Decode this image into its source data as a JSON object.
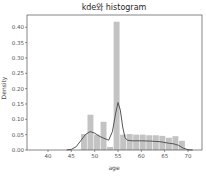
{
  "chart_data": {
    "type": "bar",
    "title": "kde와 histogram",
    "xlabel": "age",
    "ylabel": "Density",
    "xlim": [
      35.5,
      73
    ],
    "ylim": [
      0,
      0.44
    ],
    "xticks": [
      40,
      45,
      50,
      55,
      60,
      65,
      70
    ],
    "yticks": [
      0.0,
      0.05,
      0.1,
      0.15,
      0.2,
      0.25,
      0.3,
      0.35,
      0.4
    ],
    "grid": false,
    "legend": null,
    "histogram": {
      "color": "#b8b8b8",
      "bins": [
        {
          "x0": 47.0,
          "x1": 48.4,
          "density": 0.052
        },
        {
          "x0": 48.4,
          "x1": 49.8,
          "density": 0.115
        },
        {
          "x0": 49.8,
          "x1": 51.2,
          "density": 0.05
        },
        {
          "x0": 51.2,
          "x1": 52.6,
          "density": 0.092
        },
        {
          "x0": 52.6,
          "x1": 54.0,
          "density": 0.01
        },
        {
          "x0": 54.0,
          "x1": 55.4,
          "density": 0.418
        },
        {
          "x0": 55.4,
          "x1": 56.8,
          "density": 0.05
        },
        {
          "x0": 56.8,
          "x1": 58.2,
          "density": 0.052
        },
        {
          "x0": 58.2,
          "x1": 59.6,
          "density": 0.05
        },
        {
          "x0": 59.6,
          "x1": 61.0,
          "density": 0.05
        },
        {
          "x0": 61.0,
          "x1": 62.4,
          "density": 0.048
        },
        {
          "x0": 62.4,
          "x1": 63.8,
          "density": 0.048
        },
        {
          "x0": 63.8,
          "x1": 65.2,
          "density": 0.046
        },
        {
          "x0": 65.2,
          "x1": 66.6,
          "density": 0.04
        },
        {
          "x0": 66.6,
          "x1": 68.0,
          "density": 0.045
        },
        {
          "x0": 68.0,
          "x1": 69.4,
          "density": 0.03
        }
      ]
    },
    "kde": {
      "color": "#555555",
      "x": [
        44,
        45,
        46,
        47,
        48,
        49,
        50,
        51,
        52,
        53,
        53.8,
        54.5,
        55,
        55.5,
        56,
        56.5,
        57,
        58,
        60,
        62,
        64,
        66,
        67,
        68,
        69,
        70,
        71
      ],
      "y": [
        0.0,
        0.002,
        0.01,
        0.03,
        0.05,
        0.06,
        0.055,
        0.045,
        0.038,
        0.032,
        0.06,
        0.12,
        0.155,
        0.13,
        0.075,
        0.04,
        0.032,
        0.03,
        0.03,
        0.029,
        0.027,
        0.022,
        0.02,
        0.015,
        0.006,
        0.001,
        0.0
      ]
    }
  }
}
